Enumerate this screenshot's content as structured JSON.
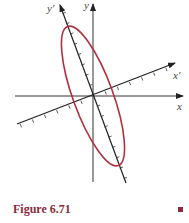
{
  "figure": {
    "caption": "Figure 6.71",
    "colors": {
      "axis": "#333333",
      "ellipse": "#b03040",
      "caption": "#8a2c3c"
    },
    "axes": {
      "x_label": "x",
      "y_label": "y",
      "x_prime_label": "x′",
      "y_prime_label": "y′"
    },
    "ellipse": {
      "description": "rotated ellipse with major axis along y' axis",
      "center": [
        93,
        96
      ],
      "semi_major_px": 74,
      "semi_minor_px": 20,
      "rotation_deg_from_vertical": -20
    },
    "ticks": {
      "x_prime_tick_count_each_side": 6,
      "y_prime_tick_count_each_side": 8
    }
  }
}
